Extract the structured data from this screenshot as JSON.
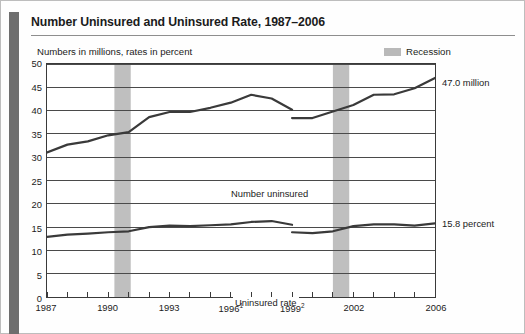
{
  "document": {
    "title": "Number Uninsured and Uninsured Rate, 1987–2006",
    "subtitle": "Numbers in millions, rates in percent"
  },
  "legend": {
    "recession_label": "Recession",
    "recession_color": "#bfbfbf"
  },
  "callouts": {
    "number_uninsured": "47.0 million",
    "uninsured_rate": "15.8 percent"
  },
  "series_labels": {
    "number_uninsured": "Number uninsured",
    "uninsured_rate": "Uninsured rate"
  },
  "axes": {
    "y_ticks": [
      "50",
      "45",
      "40",
      "35",
      "30",
      "25",
      "20",
      "15",
      "10",
      "5",
      "0"
    ],
    "x_tick_labels": [
      {
        "year": 1987,
        "text": "1987",
        "sup": ""
      },
      {
        "year": 1990,
        "text": "1990",
        "sup": ""
      },
      {
        "year": 1993,
        "text": "1993",
        "sup": ""
      },
      {
        "year": 1996,
        "text": "1996",
        "sup": "1"
      },
      {
        "year": 1999,
        "text": "1999",
        "sup": "2"
      },
      {
        "year": 2002,
        "text": "2002",
        "sup": ""
      },
      {
        "year": 2006,
        "text": "2006",
        "sup": ""
      }
    ]
  },
  "chart_data": {
    "type": "line",
    "title": "Number Uninsured and Uninsured Rate, 1987–2006",
    "subtitle": "Numbers in millions, rates in percent",
    "xlabel": "",
    "ylabel": "",
    "ylim": [
      0,
      50
    ],
    "xlim": [
      1987,
      2006
    ],
    "ytick_step": 5,
    "grid": true,
    "legend_position": "top-right",
    "x": [
      1987,
      1988,
      1989,
      1990,
      1991,
      1992,
      1993,
      1994,
      1995,
      1996,
      1997,
      1998,
      1999,
      2000,
      2001,
      2002,
      2003,
      2004,
      2005,
      2006
    ],
    "series": [
      {
        "name": "Number uninsured",
        "unit": "millions",
        "color": "#3a3a3a",
        "segments": [
          {
            "x": [
              1987,
              1988,
              1989,
              1990,
              1991,
              1992,
              1993,
              1994,
              1995,
              1996,
              1997,
              1998,
              1999
            ],
            "values": [
              31.0,
              32.7,
              33.4,
              34.7,
              35.4,
              38.6,
              39.7,
              39.7,
              40.6,
              41.7,
              43.4,
              42.6,
              40.2
            ]
          },
          {
            "x": [
              1999,
              2000,
              2001,
              2002,
              2003,
              2004,
              2005,
              2006
            ],
            "values": [
              38.4,
              38.4,
              39.8,
              41.2,
              43.4,
              43.5,
              44.8,
              47.0
            ]
          }
        ]
      },
      {
        "name": "Uninsured rate",
        "unit": "percent",
        "color": "#3a3a3a",
        "segments": [
          {
            "x": [
              1987,
              1988,
              1989,
              1990,
              1991,
              1992,
              1993,
              1994,
              1995,
              1996,
              1997,
              1998,
              1999
            ],
            "values": [
              12.9,
              13.4,
              13.6,
              13.9,
              14.1,
              15.0,
              15.3,
              15.2,
              15.4,
              15.6,
              16.1,
              16.3,
              15.5
            ]
          },
          {
            "x": [
              1999,
              2000,
              2001,
              2002,
              2003,
              2004,
              2005,
              2006
            ],
            "values": [
              13.9,
              13.7,
              14.1,
              15.2,
              15.6,
              15.6,
              15.3,
              15.8
            ]
          }
        ]
      }
    ],
    "recessions": [
      {
        "start": 1990.3,
        "end": 1991.1,
        "label": "Recession"
      },
      {
        "start": 2001.0,
        "end": 2001.8,
        "label": "Recession"
      }
    ],
    "annotations": [
      {
        "text": "47.0 million",
        "at_x": 2006,
        "at_y": 47.0
      },
      {
        "text": "15.8 percent",
        "at_x": 2006,
        "at_y": 15.8
      }
    ]
  }
}
